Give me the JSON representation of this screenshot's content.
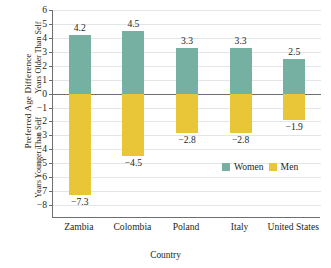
{
  "chart_data": {
    "type": "bar",
    "title": "",
    "xlabel": "Country",
    "ylabel": "Preferred Age Difference",
    "ylabel_upper": "Years Older Than Self",
    "ylabel_lower": "Years Younger Than Self",
    "categories": [
      "Zambia",
      "Colombia",
      "Poland",
      "Italy",
      "United States"
    ],
    "series": [
      {
        "name": "Women",
        "color": "#76b0a2",
        "values": [
          4.2,
          4.5,
          3.3,
          3.3,
          2.5
        ]
      },
      {
        "name": "Men",
        "color": "#e8c638",
        "values": [
          -7.3,
          -4.5,
          -2.8,
          -2.8,
          -1.9
        ]
      }
    ],
    "ylim": [
      -8,
      6
    ],
    "yticks": [
      6,
      5,
      4,
      3,
      2,
      1,
      0,
      -1,
      -2,
      -3,
      -4,
      -5,
      -6,
      -7,
      -8
    ],
    "ytick_labels": [
      "6",
      "5",
      "4",
      "3",
      "2",
      "1",
      "0",
      "−1",
      "−2",
      "−3",
      "−4",
      "−5",
      "−6",
      "−7",
      "−8"
    ],
    "data_labels": {
      "women": [
        "4.2",
        "4.5",
        "3.3",
        "3.3",
        "2.5"
      ],
      "men": [
        "−7.3",
        "−4.5",
        "−2.8",
        "−2.8",
        "−1.9"
      ]
    },
    "grid": true,
    "legend_position": "inside-bottom-right",
    "zero_line": true
  },
  "colors": {
    "women": "#76b0a2",
    "men": "#e8c638",
    "axis": "#6d6e71",
    "grid": "#e3e6e8",
    "text": "#231f20"
  }
}
